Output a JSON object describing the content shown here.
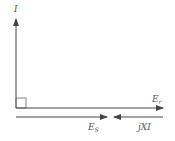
{
  "diagram": {
    "type": "phasor diagram",
    "colors": {
      "line": "#444444",
      "label": "#555555",
      "background": "#ffffff"
    },
    "labels": {
      "current": {
        "main": "I",
        "sub": ""
      },
      "rotor_emf": {
        "main": "E",
        "sub": "r"
      },
      "stator_emf": {
        "main": "E",
        "sub": "S"
      },
      "reactance_drop": {
        "main": "jXI",
        "sub": ""
      }
    },
    "elements": [
      {
        "name": "I",
        "direction": "up",
        "from": [
          16,
          108
        ],
        "to": [
          16,
          20
        ]
      },
      {
        "name": "E_r",
        "direction": "right",
        "from": [
          16,
          108
        ],
        "to": [
          162,
          108
        ]
      },
      {
        "name": "E_S",
        "direction": "right",
        "from": [
          16,
          117
        ],
        "to": [
          106,
          117
        ]
      },
      {
        "name": "jXI",
        "direction": "left",
        "from": [
          162,
          117
        ],
        "to": [
          115,
          117
        ]
      }
    ],
    "right_angle_marker": true
  }
}
